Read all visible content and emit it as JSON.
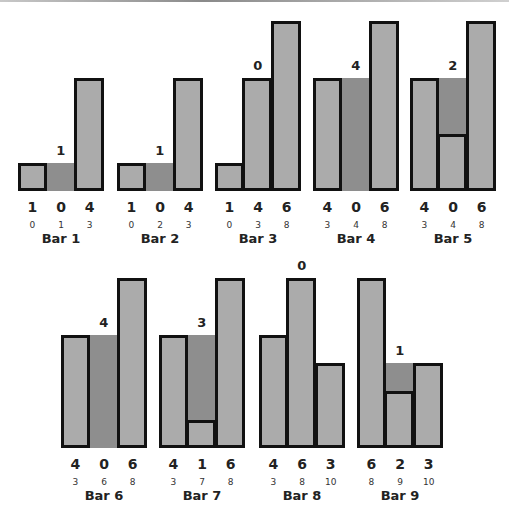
{
  "figure": {
    "caption": "",
    "unit_px": 28.5,
    "colors": {
      "bar": "#ababab",
      "water": "#8e8e8e",
      "border": "#111111"
    }
  },
  "chart_data": {
    "type": "bar",
    "groups": [
      {
        "name": "Bar 1",
        "heights": [
          1,
          0,
          4
        ],
        "indices": [
          0,
          1,
          3
        ],
        "water": 1,
        "row": 0
      },
      {
        "name": "Bar 2",
        "heights": [
          1,
          0,
          4
        ],
        "indices": [
          0,
          2,
          3
        ],
        "water": 1,
        "row": 0
      },
      {
        "name": "Bar 3",
        "heights": [
          1,
          4,
          6
        ],
        "indices": [
          0,
          3,
          8
        ],
        "water": 0,
        "row": 0
      },
      {
        "name": "Bar 4",
        "heights": [
          4,
          0,
          6
        ],
        "indices": [
          3,
          4,
          8
        ],
        "water": 4,
        "row": 0
      },
      {
        "name": "Bar 5",
        "heights": [
          4,
          0,
          6
        ],
        "indices": [
          3,
          4,
          8
        ],
        "water": 2,
        "row": 0,
        "drawn_middle_height": 2
      },
      {
        "name": "Bar 6",
        "heights": [
          4,
          0,
          6
        ],
        "indices": [
          3,
          6,
          8
        ],
        "water": 4,
        "row": 1
      },
      {
        "name": "Bar 7",
        "heights": [
          4,
          1,
          6
        ],
        "indices": [
          3,
          7,
          8
        ],
        "water": 3,
        "row": 1
      },
      {
        "name": "Bar 8",
        "heights": [
          4,
          6,
          3
        ],
        "indices": [
          3,
          8,
          10
        ],
        "water": 0,
        "row": 1
      },
      {
        "name": "Bar 9",
        "heights": [
          6,
          2,
          3
        ],
        "indices": [
          8,
          9,
          10
        ],
        "water": 1,
        "row": 1
      }
    ]
  },
  "groups": [
    {
      "name": "Bar 1",
      "h": [
        "1",
        "0",
        "4"
      ],
      "i": [
        "0",
        "1",
        "3"
      ],
      "w": "1"
    },
    {
      "name": "Bar 2",
      "h": [
        "1",
        "0",
        "4"
      ],
      "i": [
        "0",
        "2",
        "3"
      ],
      "w": "1"
    },
    {
      "name": "Bar 3",
      "h": [
        "1",
        "4",
        "6"
      ],
      "i": [
        "0",
        "3",
        "8"
      ],
      "w": "0"
    },
    {
      "name": "Bar 4",
      "h": [
        "4",
        "0",
        "6"
      ],
      "i": [
        "3",
        "4",
        "8"
      ],
      "w": "4"
    },
    {
      "name": "Bar 5",
      "h": [
        "4",
        "0",
        "6"
      ],
      "i": [
        "3",
        "4",
        "8"
      ],
      "w": "2"
    },
    {
      "name": "Bar 6",
      "h": [
        "4",
        "0",
        "6"
      ],
      "i": [
        "3",
        "6",
        "8"
      ],
      "w": "4"
    },
    {
      "name": "Bar 7",
      "h": [
        "4",
        "1",
        "6"
      ],
      "i": [
        "3",
        "7",
        "8"
      ],
      "w": "3"
    },
    {
      "name": "Bar 8",
      "h": [
        "4",
        "6",
        "3"
      ],
      "i": [
        "3",
        "8",
        "10"
      ],
      "w": "0"
    },
    {
      "name": "Bar 9",
      "h": [
        "6",
        "2",
        "3"
      ],
      "i": [
        "8",
        "9",
        "10"
      ],
      "w": "1"
    }
  ]
}
